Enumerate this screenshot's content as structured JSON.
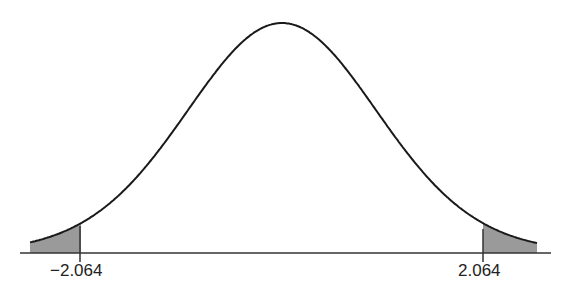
{
  "chart_data": {
    "type": "area",
    "title": "",
    "xlabel": "",
    "ylabel": "",
    "tick_labels": [
      "−2.064",
      "2.064"
    ],
    "critical_values": [
      -2.064,
      2.064
    ],
    "shaded_regions": [
      {
        "name": "left-tail",
        "from": "-inf",
        "to": -2.064
      },
      {
        "name": "right-tail",
        "from": 2.064,
        "to": "inf"
      }
    ],
    "grid": false,
    "legend": null,
    "colors": {
      "curve": "#1a1a1a",
      "shade": "#9a9a9a",
      "axis": "#333333"
    }
  },
  "labels": {
    "left": "−2.064",
    "right": "2.064"
  }
}
